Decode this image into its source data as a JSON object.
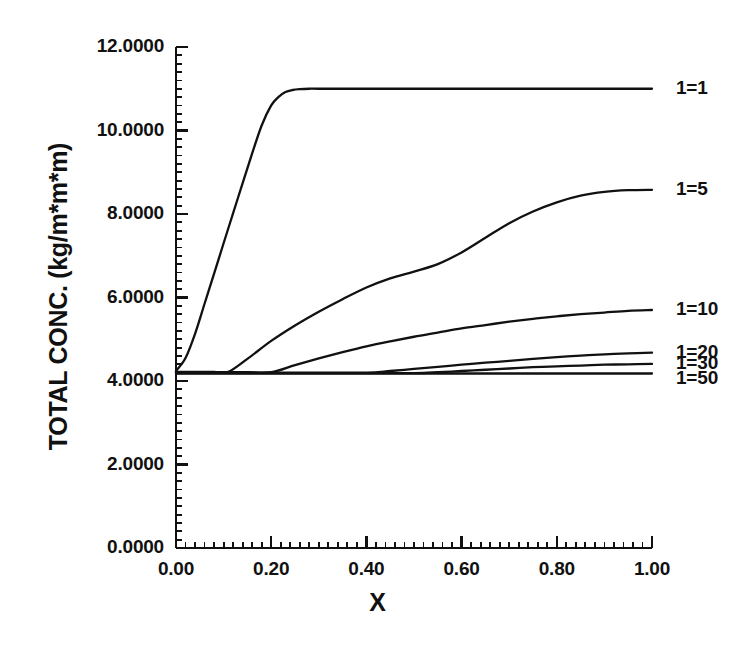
{
  "chart_data": {
    "type": "line",
    "title": "",
    "xlabel": "X",
    "ylabel": "TOTAL CONC. (kg/m*m*m)",
    "xlim": [
      0.0,
      1.0
    ],
    "ylim": [
      0.0,
      12.0
    ],
    "xticks": [
      "0.00",
      "0.20",
      "0.40",
      "0.60",
      "0.80",
      "1.00"
    ],
    "xtick_values": [
      0.0,
      0.2,
      0.4,
      0.6,
      0.8,
      1.0
    ],
    "yticks": [
      "0.0000",
      "2.0000",
      "4.0000",
      "6.0000",
      "8.0000",
      "10.0000",
      "12.0000"
    ],
    "ytick_values": [
      0.0,
      2.0,
      4.0,
      6.0,
      8.0,
      10.0,
      12.0
    ],
    "minor_ticks_per_interval": 10,
    "grid": false,
    "legend_position": "right-inline-labels",
    "line_color": "#111111",
    "background_color": "#ffffff",
    "series": [
      {
        "name": "1=1",
        "label": "1=1",
        "label_x": 1.0,
        "label_y": 11.0,
        "x": [
          0.0,
          0.02,
          0.04,
          0.06,
          0.08,
          0.1,
          0.12,
          0.14,
          0.16,
          0.18,
          0.2,
          0.215,
          0.23,
          0.245,
          0.26,
          0.28,
          0.3,
          0.4,
          0.5,
          0.6,
          0.7,
          0.8,
          0.9,
          1.0
        ],
        "values": [
          4.24,
          4.55,
          5.13,
          5.85,
          6.57,
          7.3,
          8.02,
          8.74,
          9.45,
          10.12,
          10.6,
          10.8,
          10.92,
          10.97,
          10.99,
          11.0,
          11.0,
          11.0,
          11.0,
          11.0,
          11.0,
          11.0,
          11.0,
          11.0
        ]
      },
      {
        "name": "1=5",
        "label": "1=5",
        "label_x": 1.0,
        "label_y": 8.57,
        "x": [
          0.0,
          0.04,
          0.08,
          0.11,
          0.15,
          0.2,
          0.25,
          0.3,
          0.35,
          0.4,
          0.45,
          0.5,
          0.55,
          0.6,
          0.65,
          0.7,
          0.75,
          0.8,
          0.85,
          0.9,
          0.95,
          1.0
        ],
        "values": [
          4.22,
          4.22,
          4.22,
          4.22,
          4.53,
          4.96,
          5.33,
          5.66,
          5.96,
          6.24,
          6.46,
          6.62,
          6.8,
          7.08,
          7.43,
          7.78,
          8.06,
          8.28,
          8.44,
          8.53,
          8.57,
          8.58
        ]
      },
      {
        "name": "1=10",
        "label": "1=10",
        "label_x": 1.0,
        "label_y": 5.7,
        "x": [
          0.0,
          0.05,
          0.1,
          0.15,
          0.2,
          0.25,
          0.3,
          0.35,
          0.4,
          0.45,
          0.5,
          0.55,
          0.6,
          0.65,
          0.7,
          0.75,
          0.8,
          0.85,
          0.9,
          0.95,
          1.0
        ],
        "values": [
          4.21,
          4.21,
          4.21,
          4.21,
          4.21,
          4.38,
          4.54,
          4.69,
          4.83,
          4.95,
          5.06,
          5.16,
          5.26,
          5.34,
          5.42,
          5.49,
          5.55,
          5.6,
          5.64,
          5.68,
          5.7
        ]
      },
      {
        "name": "1=20",
        "label": "1=20",
        "label_x": 1.0,
        "label_y": 4.68,
        "x": [
          0.0,
          0.1,
          0.2,
          0.3,
          0.4,
          0.45,
          0.5,
          0.55,
          0.6,
          0.65,
          0.7,
          0.75,
          0.8,
          0.85,
          0.9,
          0.95,
          1.0
        ],
        "values": [
          4.2,
          4.2,
          4.2,
          4.2,
          4.2,
          4.24,
          4.29,
          4.34,
          4.39,
          4.44,
          4.48,
          4.53,
          4.57,
          4.61,
          4.64,
          4.66,
          4.68
        ]
      },
      {
        "name": "1=30",
        "label": "1=30",
        "label_x": 1.0,
        "label_y": 4.4,
        "x": [
          0.0,
          0.1,
          0.2,
          0.3,
          0.4,
          0.5,
          0.55,
          0.6,
          0.65,
          0.7,
          0.75,
          0.8,
          0.85,
          0.9,
          0.95,
          1.0
        ],
        "values": [
          4.19,
          4.19,
          4.19,
          4.19,
          4.19,
          4.19,
          4.21,
          4.24,
          4.27,
          4.3,
          4.33,
          4.35,
          4.37,
          4.39,
          4.4,
          4.41
        ]
      },
      {
        "name": "1=50",
        "label": "1=50",
        "label_x": 1.0,
        "label_y": 4.05,
        "x": [
          0.0,
          1.0
        ],
        "values": [
          4.18,
          4.18
        ]
      }
    ]
  }
}
